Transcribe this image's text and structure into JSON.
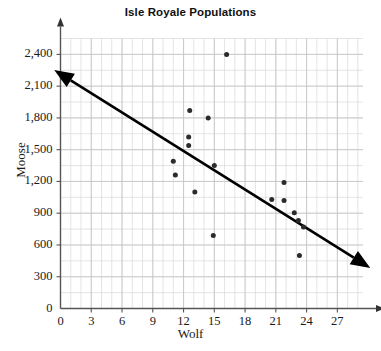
{
  "chart_data": {
    "type": "scatter",
    "title": "Isle Royale Populations",
    "xlabel": "Wolf",
    "ylabel": "Moose",
    "xlim": [
      0,
      29.5
    ],
    "ylim": [
      0,
      2550
    ],
    "xticks": [
      "0",
      "3",
      "6",
      "9",
      "12",
      "15",
      "18",
      "21",
      "24",
      "27"
    ],
    "xtick_values": [
      0,
      3,
      6,
      9,
      12,
      15,
      18,
      21,
      24,
      27
    ],
    "yticks": [
      "0",
      "300",
      "600",
      "900",
      "1,200",
      "1,500",
      "1,800",
      "2,100",
      "2,400"
    ],
    "ytick_values": [
      0,
      300,
      600,
      900,
      1200,
      1500,
      1800,
      2100,
      2400
    ],
    "grid": true,
    "grid_minor_x_step": 1,
    "grid_minor_y_step": 150,
    "legend": "none",
    "marker_color": "#2b2b2b",
    "line_color": "#000000",
    "grid_color": "#d8d8d8",
    "axis_color": "#555555",
    "points": [
      {
        "x": 11.0,
        "y": 1390
      },
      {
        "x": 11.2,
        "y": 1260
      },
      {
        "x": 12.6,
        "y": 1870
      },
      {
        "x": 12.5,
        "y": 1620
      },
      {
        "x": 12.5,
        "y": 1540
      },
      {
        "x": 13.1,
        "y": 1100
      },
      {
        "x": 14.4,
        "y": 1800
      },
      {
        "x": 15.0,
        "y": 1350
      },
      {
        "x": 14.9,
        "y": 690
      },
      {
        "x": 16.2,
        "y": 2400
      },
      {
        "x": 20.6,
        "y": 1030
      },
      {
        "x": 21.8,
        "y": 1190
      },
      {
        "x": 21.8,
        "y": 1020
      },
      {
        "x": 22.8,
        "y": 905
      },
      {
        "x": 23.2,
        "y": 830
      },
      {
        "x": 23.7,
        "y": 770
      },
      {
        "x": 23.3,
        "y": 500
      }
    ],
    "trend_line": {
      "x1": 1.0,
      "y1": 2155,
      "x2": 28.6,
      "y2": 480,
      "arrow_start": true,
      "arrow_end": true
    }
  }
}
